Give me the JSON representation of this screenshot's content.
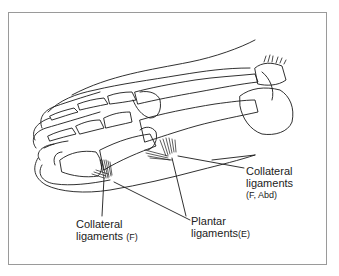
{
  "figure": {
    "labels": [
      {
        "id": "collateral_abd",
        "line1": "Collateral",
        "line2": "ligaments",
        "line3": "(F, Abd)"
      },
      {
        "id": "collateral_f",
        "line1": "Collateral",
        "line2": "ligaments",
        "suffix": "(F)"
      },
      {
        "id": "plantar",
        "line1": "Plantar",
        "line2": "ligaments",
        "suffix": "(E)"
      }
    ]
  },
  "colors": {
    "line": "#1a1a1a",
    "frame": "#9a9a9a",
    "background": "#ffffff"
  }
}
